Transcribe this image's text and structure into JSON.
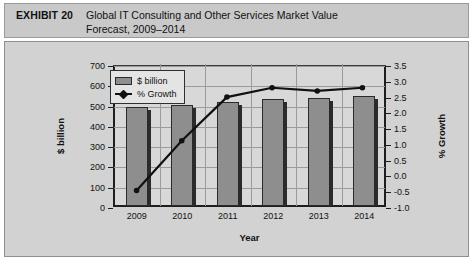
{
  "header": {
    "exhibit_label": "EXHIBIT 20",
    "title_line1": "Global IT Consulting and Other Services Market Value",
    "title_line2": "Forecast, 2009–2014"
  },
  "legend": {
    "bar_label": "$ billion",
    "line_label": "% Growth"
  },
  "colors": {
    "header_band": "#c9c9c9",
    "panel_bg": "#d2d2d2",
    "plot_bg": "#d8d8d8",
    "bar_fill": "#8e8e8e",
    "bar_outline": "#2a2a2a",
    "line": "#111111",
    "gridline": "#9b9b9b",
    "axis": "#1e1e1e"
  },
  "chart_data": {
    "type": "bar",
    "title": "Global IT Consulting and Other Services Market Value Forecast, 2009–2014",
    "categories": [
      "2009",
      "2010",
      "2011",
      "2012",
      "2013",
      "2014"
    ],
    "xlabel": "Year",
    "ylabel": "$ billion",
    "y2label": "% Growth",
    "ylim": [
      0,
      700
    ],
    "y2lim": [
      -1.0,
      3.5
    ],
    "yticks": [
      0,
      100,
      200,
      300,
      400,
      500,
      600,
      700
    ],
    "y2ticks": [
      -1.0,
      -0.5,
      0.0,
      0.5,
      1.0,
      1.5,
      2.0,
      2.5,
      3.0,
      3.5
    ],
    "ytick_labels": [
      "0",
      "100",
      "200",
      "300",
      "400",
      "500",
      "600",
      "700"
    ],
    "y2tick_labels": [
      "-1.0",
      "-0.5",
      "0.0",
      "0.5",
      "1.0",
      "1.5",
      "2.0",
      "2.5",
      "3.0",
      "3.5"
    ],
    "grid": true,
    "legend_position": "top-left",
    "series": [
      {
        "name": "$ billion",
        "type": "bar",
        "axis": "left",
        "values": [
          490,
          497,
          513,
          527,
          534,
          543
        ]
      },
      {
        "name": "% Growth",
        "type": "line",
        "axis": "right",
        "values": [
          -0.5,
          1.1,
          2.5,
          2.8,
          2.7,
          2.8
        ]
      }
    ]
  }
}
